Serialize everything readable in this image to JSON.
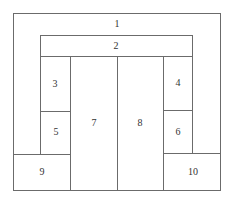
{
  "diagram": {
    "type": "floor-plan-partition",
    "line_color": "#6b6b6b",
    "regions": [
      {
        "id": "1",
        "label": "1",
        "description": "outer frame region"
      },
      {
        "id": "2",
        "label": "2",
        "description": "top inner band"
      },
      {
        "id": "3",
        "label": "3"
      },
      {
        "id": "4",
        "label": "4"
      },
      {
        "id": "5",
        "label": "5"
      },
      {
        "id": "6",
        "label": "6"
      },
      {
        "id": "7",
        "label": "7"
      },
      {
        "id": "8",
        "label": "8"
      },
      {
        "id": "9",
        "label": "9"
      },
      {
        "id": "10",
        "label": "10"
      }
    ]
  }
}
